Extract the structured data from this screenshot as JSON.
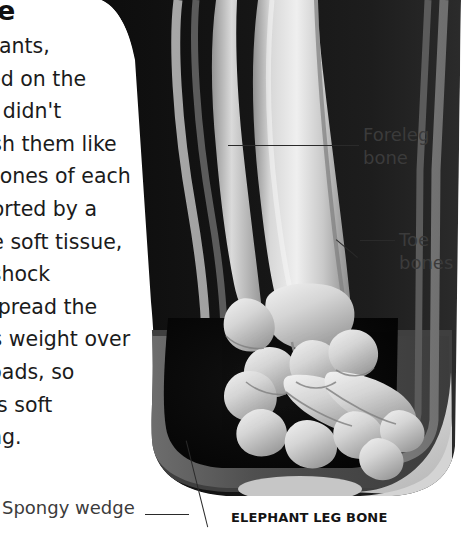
{
  "article": {
    "headline": "toe",
    "body_lines": [
      "elephants,",
      "walked on the",
      "but it didn't",
      "squash them like",
      "The bones of each",
      "supported by a",
      "dense soft tissue,",
      "as a shock",
      "and spread the",
      "imal's weight over",
      "foot pads, so",
      "across soft",
      "sinking."
    ]
  },
  "labels": {
    "foreleg": "Foreleg\nbone",
    "foreleg_line1": "Foreleg",
    "foreleg_line2": "bone",
    "toe_line1": "Toe",
    "toe_line2": "bones",
    "spongy": "Spongy wedge",
    "caption": "ELEPHANT LEG BONE"
  },
  "colors": {
    "background": "#ffffff",
    "skin_dark": "#121212",
    "soft_tissue_mid": "#4a4a4a",
    "soft_tissue_rim": "#8f8f8f",
    "pad_cavity": "#0a0a0a",
    "hoof_light": "#d2d2d2",
    "bone_light": "#e8e8e8",
    "bone_mid": "#b4b4b4",
    "label_text": "#3b3b3b",
    "leader_line": "#2a2a2a",
    "headline_text": "#111111"
  },
  "figure": {
    "type": "anatomical-xray-illustration",
    "subject": "elephant leg bone",
    "parts": [
      "foreleg bone",
      "toe bones",
      "spongy wedge",
      "foot pad",
      "hoof wall"
    ]
  }
}
